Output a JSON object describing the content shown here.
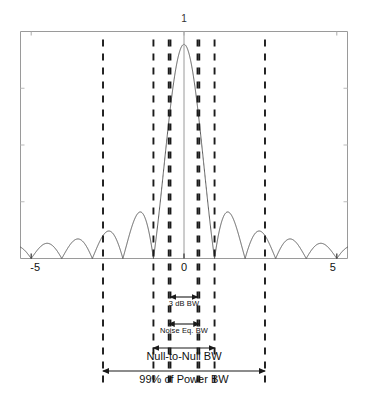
{
  "figure": {
    "title": "",
    "background": "#ffffff",
    "curve_color": "#4a4a4a",
    "frame_color": "#9a9a9a",
    "dash_color": "#1a1a1a",
    "arrow_color": "#1a1a1a"
  },
  "axis": {
    "x_tick_labels": [
      "-5",
      "0",
      "5"
    ],
    "x_tick_values": [
      -5,
      0,
      5
    ],
    "peak_label": "1",
    "peak_value": 1
  },
  "annotations": {
    "three_db": "3 dB BW",
    "noise_eq": "Noise Eq. BW",
    "null_to_null": "Null-to-Null BW",
    "power99": "99% of Power BW"
  },
  "chart_data": {
    "type": "line",
    "title": "",
    "xlabel": "",
    "ylabel": "",
    "xlim": [
      -5.35,
      5.35
    ],
    "ylim": [
      0,
      1.06
    ],
    "grid": false,
    "legend": null,
    "function": "abs(sinc(x)) = |sin(pi*x)/(pi*x)|",
    "x_tick_values": [
      -5,
      0,
      5
    ],
    "x_tick_labels": [
      "-5",
      "0",
      "5"
    ],
    "y_tick_values": [
      1
    ],
    "y_tick_labels": [
      "1"
    ],
    "nulls": [
      -5,
      -4,
      -3,
      -2,
      -1,
      1,
      2,
      3,
      4,
      5
    ],
    "peak": {
      "x": 0,
      "y": 1
    },
    "sidelobe_peaks": [
      {
        "x": -4.47,
        "y": 0.071
      },
      {
        "x": -3.47,
        "y": 0.091
      },
      {
        "x": -2.46,
        "y": 0.126
      },
      {
        "x": -1.43,
        "y": 0.217
      },
      {
        "x": 1.43,
        "y": 0.217
      },
      {
        "x": 2.46,
        "y": 0.126
      },
      {
        "x": 3.47,
        "y": 0.091
      },
      {
        "x": 4.47,
        "y": 0.071
      }
    ],
    "markers": [
      {
        "name": "3dB-left",
        "x": -0.443,
        "style": "dashed"
      },
      {
        "name": "3dB-right",
        "x": 0.443,
        "style": "dashed"
      },
      {
        "name": "noise-eq-left",
        "x": -0.5,
        "style": "dashed"
      },
      {
        "name": "noise-eq-right",
        "x": 0.5,
        "style": "dashed"
      },
      {
        "name": "null-to-null-left",
        "x": -1,
        "style": "dashed"
      },
      {
        "name": "null-to-null-right",
        "x": 1,
        "style": "dashed"
      },
      {
        "name": "99pct-power-left",
        "x": -2.65,
        "style": "dashed"
      },
      {
        "name": "99pct-power-right",
        "x": 2.65,
        "style": "dashed"
      }
    ],
    "bandwidth_spans": [
      {
        "label": "3 dB BW",
        "from": -0.443,
        "to": 0.443,
        "width": 0.886
      },
      {
        "label": "Noise Eq. BW",
        "from": -0.5,
        "to": 0.5,
        "width": 1.0
      },
      {
        "label": "Null-to-Null BW",
        "from": -1.0,
        "to": 1.0,
        "width": 2.0
      },
      {
        "label": "99% of Power BW",
        "from": -2.65,
        "to": 2.65,
        "width": 5.3
      }
    ]
  }
}
